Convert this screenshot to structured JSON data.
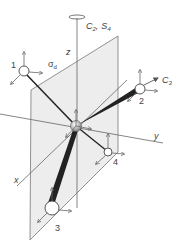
{
  "labels": {
    "z_axis": "z",
    "y_axis": "y",
    "x_axis": "x",
    "principal_axis": "C",
    "principal_axis_sub": "2",
    "principal_axis_sep": ",",
    "improper_axis": "S",
    "improper_axis_sub": "4",
    "mirror_plane": "σ",
    "mirror_plane_sub": "d",
    "c3_axis": "C",
    "c3_axis_sub": "3"
  },
  "atoms": [
    {
      "label": "1",
      "position": "upper-left"
    },
    {
      "label": "2",
      "position": "upper-right"
    },
    {
      "label": "3",
      "position": "lower-left-front"
    },
    {
      "label": "4",
      "position": "lower-right-back"
    }
  ],
  "colors": {
    "line": "#555555",
    "bond": "#222222",
    "plane_fill": "#ededed",
    "arrow": "#666666"
  }
}
